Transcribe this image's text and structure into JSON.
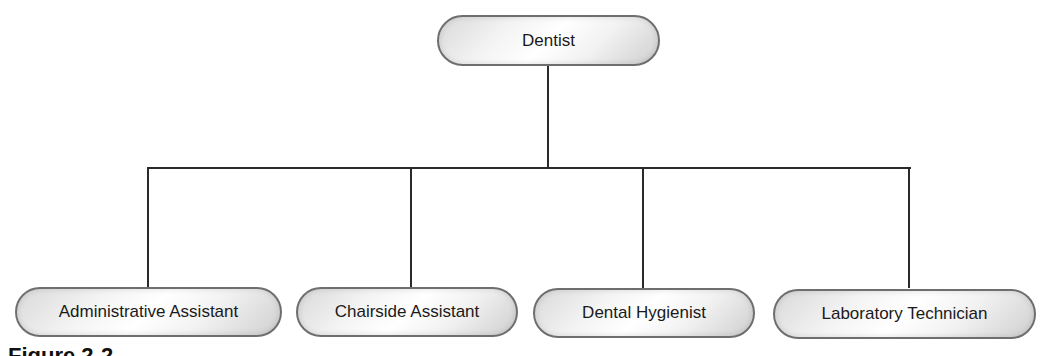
{
  "diagram": {
    "type": "org-chart",
    "root": {
      "label": "Dentist"
    },
    "children": [
      {
        "label": "Administrative Assistant"
      },
      {
        "label": "Chairside Assistant"
      },
      {
        "label": "Dental Hygienist"
      },
      {
        "label": "Laboratory Technician"
      }
    ],
    "caption": "Figure 2-2"
  },
  "colors": {
    "line": "#2a2a2a",
    "node_border": "#6e6e6e",
    "text": "#1a1a1a"
  }
}
